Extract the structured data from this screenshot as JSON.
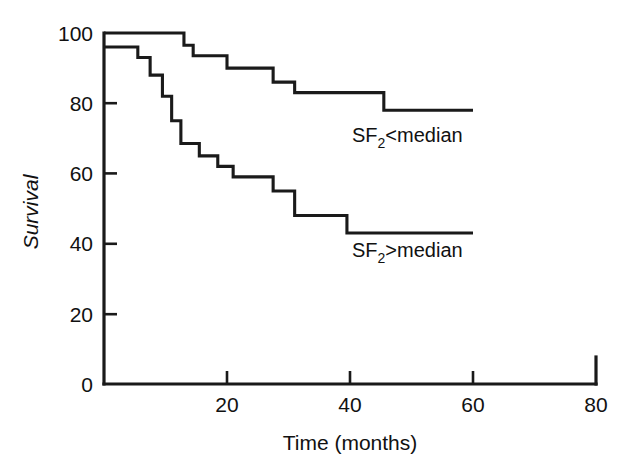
{
  "chart_data": {
    "type": "line",
    "subtype": "kaplan-meier-step",
    "title": "",
    "xlabel": "Time (months)",
    "ylabel": "Survival",
    "xlim": [
      0,
      80
    ],
    "ylim": [
      0,
      100
    ],
    "xticks": [
      20,
      40,
      60,
      80
    ],
    "xticklabels": [
      "20",
      "40",
      "60",
      "80"
    ],
    "yticks": [
      0,
      20,
      40,
      60,
      80,
      100
    ],
    "yticklabels": [
      "0",
      "20",
      "40",
      "60",
      "80",
      "100"
    ],
    "grid": false,
    "legend_position": "inline-annotations",
    "series": [
      {
        "name": "SF2 < median",
        "label_prefix": "SF",
        "label_subscript": "2",
        "label_suffix": "<median",
        "annotation_x": 38,
        "annotation_y": 70,
        "x": [
          0,
          13,
          14.5,
          20,
          23,
          27.5,
          45.5,
          60
        ],
        "y": [
          100,
          100,
          96.5,
          93.5,
          93.5,
          90,
          90,
          86
        ],
        "steps": [
          {
            "time": 0,
            "survival": 100
          },
          {
            "time": 13,
            "survival": 96.5
          },
          {
            "time": 14.5,
            "survival": 93.5
          },
          {
            "time": 20,
            "survival": 90.0
          },
          {
            "time": 23,
            "survival": 90.0
          },
          {
            "time": 27.5,
            "survival": 86.0
          },
          {
            "time": 31,
            "survival": 83.0
          },
          {
            "time": 45.5,
            "survival": 78.0
          },
          {
            "time": 60,
            "survival": 78.0
          }
        ]
      },
      {
        "name": "SF2 > median",
        "label_prefix": "SF",
        "label_subscript": "2",
        "label_suffix": ">median",
        "annotation_x": 38,
        "annotation_y": 36,
        "x": [
          0,
          5,
          7,
          9,
          11,
          13,
          15,
          18,
          20,
          22,
          25,
          28,
          31,
          39,
          60
        ],
        "y": [
          96,
          93,
          88,
          82,
          75,
          68,
          65,
          62,
          59,
          55,
          48,
          43,
          43,
          43,
          43
        ],
        "steps": [
          {
            "time": 0,
            "survival": 96.0
          },
          {
            "time": 5.5,
            "survival": 93.0
          },
          {
            "time": 7.5,
            "survival": 88.0
          },
          {
            "time": 9.5,
            "survival": 82.0
          },
          {
            "time": 11.0,
            "survival": 75.0
          },
          {
            "time": 12.5,
            "survival": 68.5
          },
          {
            "time": 15.5,
            "survival": 65.0
          },
          {
            "time": 18.5,
            "survival": 62.0
          },
          {
            "time": 21.0,
            "survival": 59.0
          },
          {
            "time": 27.5,
            "survival": 55.0
          },
          {
            "time": 31.0,
            "survival": 48.0
          },
          {
            "time": 39.5,
            "survival": 43.0
          },
          {
            "time": 60.0,
            "survival": 43.0
          }
        ]
      }
    ]
  },
  "axes": {
    "x_title": "Time (months)",
    "y_title": "Survival"
  },
  "annotations": {
    "upper": {
      "prefix": "SF",
      "subscript": "2",
      "suffix": "<median"
    },
    "lower": {
      "prefix": "SF",
      "subscript": "2",
      "suffix": ">median"
    }
  },
  "style": {
    "line_color": "#1a1a1a",
    "axis_color": "#1a1a1a",
    "background": "#ffffff"
  }
}
